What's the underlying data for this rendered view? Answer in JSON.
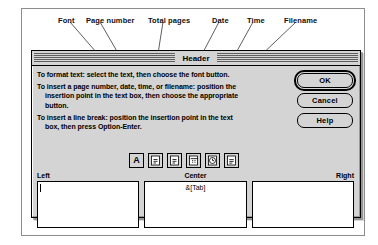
{
  "callouts": [
    {
      "label": "Font",
      "x": 58,
      "y": 16
    },
    {
      "label": "Page number",
      "x": 86,
      "y": 16
    },
    {
      "label": "Total pages",
      "x": 148,
      "y": 16
    },
    {
      "label": "Date",
      "x": 212,
      "y": 16
    },
    {
      "label": "Time",
      "x": 247,
      "y": 16
    },
    {
      "label": "Filename",
      "x": 284,
      "y": 16
    }
  ],
  "leader_lines": [
    {
      "x1": 70,
      "y1": 22,
      "x2": 103,
      "y2": 60
    },
    {
      "x1": 100,
      "y1": 22,
      "x2": 122,
      "y2": 60
    },
    {
      "x1": 163,
      "y1": 22,
      "x2": 157,
      "y2": 60
    },
    {
      "x1": 219,
      "y1": 22,
      "x2": 199,
      "y2": 60
    },
    {
      "x1": 253,
      "y1": 22,
      "x2": 232,
      "y2": 60
    },
    {
      "x1": 296,
      "y1": 22,
      "x2": 256,
      "y2": 60
    }
  ],
  "dialog": {
    "title": "Header",
    "instructions": [
      {
        "text": "To format text:  select the text, then choose the font button.",
        "indent": false
      },
      {
        "text": "To insert a page number, date, time, or filename:  position the",
        "indent": false
      },
      {
        "text": "insertion point in the text box, then choose the appropriate",
        "indent": true
      },
      {
        "text": "button.",
        "indent": true
      },
      {
        "text": "To insert a line break:  position the insertion point in the text",
        "indent": false
      },
      {
        "text": "box, then press Option-Enter.",
        "indent": true
      }
    ],
    "icon_buttons": [
      {
        "name": "font-icon",
        "title": "Font"
      },
      {
        "name": "page-number-icon",
        "title": "Page number"
      },
      {
        "name": "total-pages-icon",
        "title": "Total pages"
      },
      {
        "name": "date-icon",
        "title": "Date"
      },
      {
        "name": "time-icon",
        "title": "Time"
      },
      {
        "name": "filename-icon",
        "title": "Filename"
      }
    ],
    "buttons": {
      "ok": "OK",
      "cancel": "Cancel",
      "help": "Help"
    },
    "fields": [
      {
        "label": "Left",
        "value": "",
        "align": "left"
      },
      {
        "label": "Center",
        "value": "&[Tab]",
        "align": "center"
      },
      {
        "label": "Right",
        "value": "",
        "align": "right"
      }
    ]
  },
  "colors": {
    "dialog_bg": "#d4d4d4",
    "field_bg": "#ffffff",
    "border": "#000000",
    "frame": "#8d8d8d"
  }
}
